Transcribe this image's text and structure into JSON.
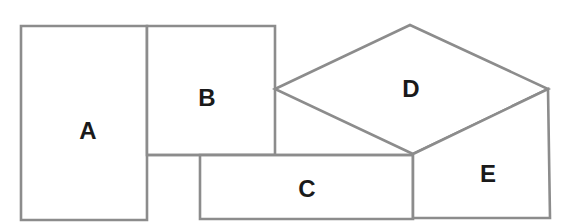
{
  "diagram": {
    "type": "region-adjacency-puzzle",
    "stroke_color": "#8c8c8c",
    "label_color": "#1a1a1a",
    "background": "#ffffff",
    "regions": [
      {
        "id": "A",
        "label": "A",
        "shape": "rectangle",
        "points": [
          [
            21,
            26
          ],
          [
            147,
            26
          ],
          [
            147,
            220
          ],
          [
            21,
            220
          ]
        ],
        "label_pos": [
          88,
          130
        ]
      },
      {
        "id": "B",
        "label": "B",
        "shape": "rectangle",
        "points": [
          [
            147,
            26
          ],
          [
            275,
            26
          ],
          [
            275,
            155
          ],
          [
            147,
            155
          ]
        ],
        "label_pos": [
          207,
          97
        ]
      },
      {
        "id": "C",
        "label": "C",
        "shape": "rectangle",
        "points": [
          [
            200,
            155
          ],
          [
            413,
            155
          ],
          [
            413,
            219
          ],
          [
            200,
            219
          ]
        ],
        "label_pos": [
          307,
          188
        ]
      },
      {
        "id": "D",
        "label": "D",
        "shape": "diamond",
        "points": [
          [
            275,
            89
          ],
          [
            410,
            25
          ],
          [
            548,
            89
          ],
          [
            413,
            154
          ]
        ],
        "label_pos": [
          411,
          88
        ]
      },
      {
        "id": "E",
        "label": "E",
        "shape": "pentagon",
        "points": [
          [
            413,
            154
          ],
          [
            548,
            89
          ],
          [
            550,
            218
          ],
          [
            413,
            218
          ]
        ],
        "label_pos": [
          488,
          173
        ]
      }
    ],
    "extra_edges": [
      {
        "from": [
          147,
          155
        ],
        "to": [
          413,
          155
        ]
      }
    ]
  }
}
